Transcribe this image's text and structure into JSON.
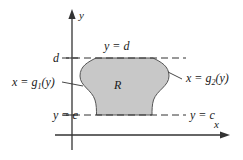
{
  "figure": {
    "background_color": "#ffffff",
    "line_color": "#333333",
    "region_fill_color": "#c8c8c8",
    "region_stroke_color": "#555555"
  },
  "axes": {
    "x_label": "x",
    "y_label": "y",
    "x_axis_name": "horizontal-axis",
    "y_axis_name": "vertical-axis"
  },
  "ticks": {
    "upper": {
      "label": "d",
      "value_name": "d"
    },
    "lower": {
      "label": "c",
      "value_name": "c"
    }
  },
  "gridlines": {
    "upper": {
      "label": "y = d",
      "style": "dashed"
    },
    "lower": {
      "label": "y = c",
      "style": "dashed"
    }
  },
  "curves": {
    "left": {
      "label_prefix": "x = g",
      "label_subscript": "1",
      "label_suffix": "(y)",
      "full_label": "x = g1(y)"
    },
    "right": {
      "label_prefix": "x = g",
      "label_subscript": "2",
      "label_suffix": "(y)",
      "full_label": "x = g2(y)"
    }
  },
  "region": {
    "label": "R"
  }
}
